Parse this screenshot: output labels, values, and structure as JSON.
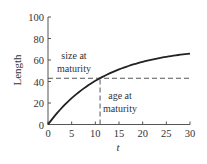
{
  "chart_data": {
    "type": "line",
    "title": "",
    "xlabel": "t",
    "ylabel": "Length",
    "xlim": [
      0,
      30
    ],
    "ylim": [
      0,
      100
    ],
    "xticks": [
      0,
      5,
      10,
      15,
      20,
      25,
      30
    ],
    "yticks": [
      0,
      20,
      40,
      60,
      80,
      100
    ],
    "grid": false,
    "series": [
      {
        "name": "growth curve",
        "model": "L(t) = 72 * (1 - exp(-0.083 t))",
        "x": [
          0,
          2,
          4,
          6,
          8,
          10,
          11,
          12,
          14,
          16,
          18,
          20,
          22,
          24,
          26,
          28,
          30
        ],
        "values": [
          0,
          11.1,
          20.5,
          28.5,
          35.3,
          40.9,
          43.1,
          45.6,
          49.6,
          53.0,
          55.9,
          58.4,
          60.5,
          62.2,
          63.7,
          65.0,
          66.0
        ]
      }
    ],
    "reference_lines": [
      {
        "orientation": "horizontal",
        "value": 43,
        "style": "dashed",
        "x_range": [
          0,
          30
        ]
      },
      {
        "orientation": "vertical",
        "value": 11,
        "style": "dashed",
        "y_range": [
          0,
          43
        ]
      }
    ],
    "annotations": [
      {
        "text_lines": [
          "size at",
          "maturity"
        ],
        "x": 5,
        "y": 52
      },
      {
        "text_lines": [
          "age at",
          "maturity"
        ],
        "x": 17,
        "y": 30
      }
    ]
  },
  "labels": {
    "xlabel": "t",
    "ylabel": "Length",
    "size_line1": "size at",
    "size_line2": "maturity",
    "age_line1": "age at",
    "age_line2": "maturity"
  }
}
